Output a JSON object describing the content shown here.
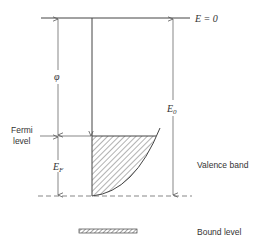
{
  "diagram": {
    "type": "energy-level-diagram",
    "labels": {
      "vacuum_level": "E = 0",
      "work_function": "φ",
      "fermi_level_line1": "Fermi",
      "fermi_level_line2": "level",
      "fermi_energy_main": "E",
      "fermi_energy_sub": "F",
      "well_depth_main": "E",
      "well_depth_sub": "0",
      "valence_band": "Valence band",
      "bound_level": "Bound level"
    },
    "colors": {
      "line": "#444444",
      "text": "#333333",
      "background": "#ffffff"
    }
  }
}
